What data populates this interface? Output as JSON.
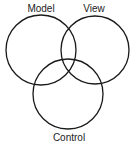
{
  "diagram": {
    "type": "venn",
    "sets": [
      {
        "id": "model",
        "label": "Model",
        "cx": 41,
        "cy": 50,
        "r": 35,
        "label_x": 41,
        "label_y": 12
      },
      {
        "id": "view",
        "label": "View",
        "cx": 95,
        "cy": 50,
        "r": 34,
        "label_x": 94,
        "label_y": 12
      },
      {
        "id": "control",
        "label": "Control",
        "cx": 68,
        "cy": 94,
        "r": 35,
        "label_x": 69,
        "label_y": 141
      }
    ],
    "stroke_color": "#1a1a1a",
    "background": "#ffffff"
  }
}
